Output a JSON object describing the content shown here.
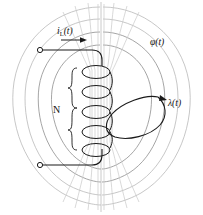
{
  "figure": {
    "background_color": "#ffffff"
  },
  "labels": {
    "current": {
      "base": "i",
      "subscript": "L",
      "argument": "(t)",
      "name": "current-label"
    },
    "flux": {
      "text": "φ(t)",
      "name": "flux-label"
    },
    "linkage": {
      "text": "λ(t)",
      "name": "flux-linkage-label"
    },
    "turns": {
      "text": "N",
      "name": "turns-label"
    }
  },
  "colors": {
    "ink": "#1a1a1a",
    "flux_line": "#b9b9b9",
    "flux_line_inner": "#8e8e8e",
    "axis": "#bdbdbd",
    "core": "#c9c9c9"
  },
  "geometry": {
    "coil_turns_drawn": 5,
    "flux_loops_per_side": 4,
    "terminals": 2
  },
  "caption": {
    "text": ""
  }
}
